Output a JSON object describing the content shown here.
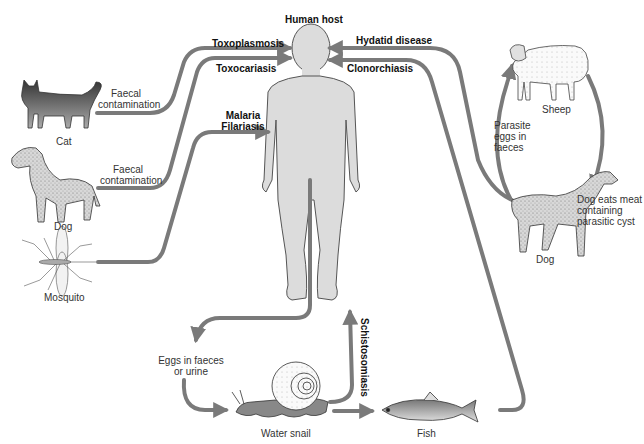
{
  "title": "Human host",
  "colors": {
    "arrow": "#7a7a7a",
    "human_fill": "#dcdcdc",
    "outline": "#444444",
    "background": "#ffffff"
  },
  "transmission_routes": [
    {
      "disease": "Toxoplasmosis",
      "source": "Cat",
      "route_label": "Faecal contamination",
      "direction": "to-human"
    },
    {
      "disease": "Toxocariasis",
      "source": "Dog",
      "route_label": "Faecal contamination",
      "direction": "to-human"
    },
    {
      "disease": "Malaria Filariasis",
      "source": "Mosquito",
      "route_label": "",
      "direction": "to-human"
    },
    {
      "disease": "Hydatid disease",
      "source": "Dog (sheep cycle)",
      "route_label": "",
      "direction": "to-human"
    },
    {
      "disease": "Clonorchiasis",
      "source": "Fish",
      "route_label": "",
      "direction": "to-human"
    },
    {
      "disease": "Schistosomiasis",
      "source": "Water snail",
      "route_label": "",
      "direction": "to-human"
    }
  ],
  "labels": {
    "human_host": "Human host",
    "toxoplasmosis": "Toxoplasmosis",
    "toxocariasis": "Toxocariasis",
    "malaria": "Malaria",
    "filariasis": "Filariasis",
    "hydatid": "Hydatid disease",
    "clonorchiasis": "Clonorchiasis",
    "schistosomiasis": "Schistosomiasis",
    "faecal_1_line1": "Faecal",
    "faecal_1_line2": "contamination",
    "faecal_2_line1": "Faecal",
    "faecal_2_line2": "contamination",
    "cat": "Cat",
    "dog_left": "Dog",
    "mosquito": "Mosquito",
    "sheep": "Sheep",
    "parasite_eggs_1": "Parasite",
    "parasite_eggs_2": "eggs in",
    "parasite_eggs_3": "faeces",
    "dog_eats_1": "Dog eats meat",
    "dog_eats_2": "containing",
    "dog_eats_3": "parasitic cyst",
    "dog_right": "Dog",
    "eggs_faeces_1": "Eggs in faeces",
    "eggs_faeces_2": "or urine",
    "water_snail": "Water snail",
    "fish": "Fish"
  }
}
